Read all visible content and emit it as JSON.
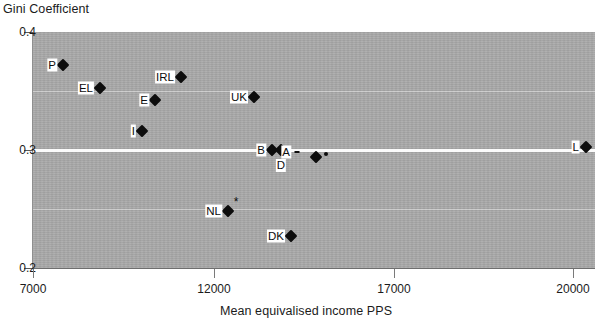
{
  "chart_data": {
    "type": "scatter",
    "title": "",
    "ylabel": "Gini Coefficient",
    "xlabel": "Mean equivalised income PPS",
    "ylim": [
      0.2,
      0.4
    ],
    "xlim": [
      7000,
      20000
    ],
    "y_ticks": [
      "0.4",
      "0.3",
      "0.2"
    ],
    "y_tick_values": [
      0.4,
      0.3,
      0.2
    ],
    "x_ticks": [
      "7000",
      "12000",
      "17000",
      "20000"
    ],
    "x_tick_values": [
      7000,
      12000,
      17000,
      20000
    ],
    "grid": true,
    "legend": "none",
    "points": [
      {
        "label": "P",
        "x": 7840,
        "y": 0.372,
        "marker": "diamond",
        "label_pos": "left"
      },
      {
        "label": "EL",
        "x": 8870,
        "y": 0.353,
        "marker": "diamond",
        "label_pos": "left"
      },
      {
        "label": "IRL",
        "x": 11140,
        "y": 0.362,
        "marker": "diamond",
        "label_pos": "left"
      },
      {
        "label": "E",
        "x": 10420,
        "y": 0.343,
        "marker": "diamond",
        "label_pos": "left"
      },
      {
        "label": "I",
        "x": 10060,
        "y": 0.317,
        "marker": "diamond",
        "label_pos": "left"
      },
      {
        "label": "UK",
        "x": 12620,
        "y": 0.347,
        "marker": "diamond",
        "label_pos": "left"
      },
      {
        "label": "B",
        "x": 13620,
        "y": 0.3,
        "marker": "diamond",
        "label_pos": "left"
      },
      {
        "label": "D",
        "x": 13870,
        "y": 0.3,
        "marker": "diamond",
        "label_pos": "below"
      },
      {
        "label": "A",
        "x": 14180,
        "y": 0.299,
        "marker": "tick",
        "label_pos": "left"
      },
      {
        "label": "",
        "x": 15150,
        "y": 0.294,
        "marker": "diamond",
        "label_pos": "none"
      },
      {
        "label": "",
        "x": 15400,
        "y": 0.296,
        "marker": "small",
        "label_pos": "none"
      },
      {
        "label": "L",
        "x": 20190,
        "y": 0.303,
        "marker": "diamond",
        "label_pos": "left"
      },
      {
        "label": "NL",
        "x": 12900,
        "y": 0.245,
        "marker": "diamond",
        "label_pos": "left"
      },
      {
        "label": "DK",
        "x": 14650,
        "y": 0.228,
        "marker": "diamond",
        "label_pos": "left"
      }
    ],
    "annotations": [
      {
        "symbol": "*",
        "near": "NL",
        "x": 13010,
        "y": 0.254
      }
    ]
  },
  "geometry": {
    "plot": {
      "left": 33,
      "top": 32,
      "width": 562,
      "height": 236
    },
    "y_tick_px": [
      32,
      150,
      268
    ],
    "x_tick_px": [
      33,
      214,
      394,
      573
    ],
    "minor_gridlines_px": [
      91,
      209,
      327
    ],
    "points_px": [
      {
        "label": "P",
        "cx": 63,
        "cy": 65
      },
      {
        "label": "EL",
        "cx": 100,
        "cy": 88
      },
      {
        "label": "IRL",
        "cx": 181,
        "cy": 77
      },
      {
        "label": "E",
        "cx": 155,
        "cy": 100
      },
      {
        "label": "I",
        "cx": 142,
        "cy": 131
      },
      {
        "label": "UK",
        "cx": 254,
        "cy": 97
      },
      {
        "label": "B",
        "cx": 272,
        "cy": 150
      },
      {
        "label": "D",
        "cx": 281,
        "cy": 150
      },
      {
        "label": "A",
        "cx": 297,
        "cy": 152
      },
      {
        "label": "",
        "cx": 316,
        "cy": 157
      },
      {
        "label": "",
        "cx": 326,
        "cy": 154
      },
      {
        "label": "L",
        "cx": 586,
        "cy": 147
      },
      {
        "label": "NL",
        "cx": 228,
        "cy": 211
      },
      {
        "label": "DK",
        "cx": 291,
        "cy": 236
      }
    ]
  }
}
